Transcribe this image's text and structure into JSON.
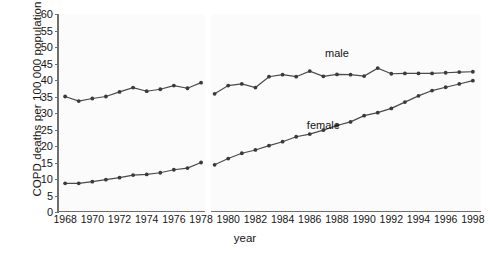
{
  "chart_data": {
    "type": "line",
    "title": "",
    "xlabel": "year",
    "ylabel": "COPD deaths per 100 000 population",
    "xlim": [
      1967.4,
      1998.6
    ],
    "ylim": [
      0,
      60
    ],
    "grid": false,
    "legend_position": "inline-annotation",
    "y_ticks": [
      0,
      5,
      10,
      15,
      20,
      25,
      30,
      35,
      40,
      45,
      50,
      55,
      60
    ],
    "x_ticks": [
      1968,
      1970,
      1972,
      1974,
      1976,
      1978,
      1980,
      1982,
      1984,
      1986,
      1988,
      1990,
      1992,
      1994,
      1996,
      1998
    ],
    "x": [
      1968,
      1969,
      1970,
      1971,
      1972,
      1973,
      1974,
      1975,
      1976,
      1977,
      1978,
      1979,
      1980,
      1981,
      1982,
      1983,
      1984,
      1985,
      1986,
      1987,
      1988,
      1989,
      1990,
      1991,
      1992,
      1993,
      1994,
      1995,
      1996,
      1997,
      1998
    ],
    "break_after_year": 1978,
    "series": [
      {
        "name": "male",
        "color": "#4a4a4a",
        "values": [
          35.0,
          33.6,
          34.4,
          35.0,
          36.4,
          37.7,
          36.6,
          37.2,
          38.3,
          37.5,
          39.2,
          35.8,
          38.3,
          38.8,
          37.7,
          41.0,
          41.6,
          41.0,
          42.7,
          41.1,
          41.7,
          41.6,
          41.2,
          43.6,
          41.9,
          42.0,
          42.0,
          42.0,
          42.2,
          42.4,
          42.5
        ]
      },
      {
        "name": "female",
        "color": "#4a4a4a",
        "values": [
          8.7,
          8.7,
          9.2,
          9.8,
          10.4,
          11.2,
          11.4,
          11.9,
          12.8,
          13.3,
          15.0,
          14.3,
          16.2,
          17.8,
          18.8,
          20.1,
          21.3,
          22.8,
          23.6,
          24.8,
          26.2,
          27.3,
          29.2,
          30.1,
          31.4,
          33.3,
          35.2,
          36.8,
          37.8,
          38.8,
          39.8
        ]
      }
    ],
    "annotations": [
      {
        "text": "male",
        "x": 1988,
        "y": 48
      },
      {
        "text": "female",
        "x": 1987,
        "y": 26
      }
    ]
  }
}
